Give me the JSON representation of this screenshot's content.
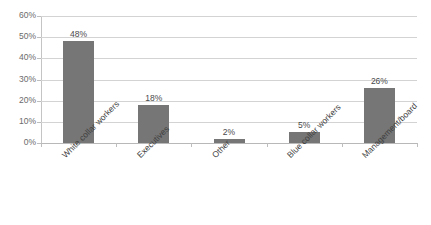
{
  "chart_data": {
    "type": "bar",
    "title": "",
    "subtitle": "",
    "xlabel": "",
    "ylabel": "",
    "categories": [
      "White collar workers",
      "Executives",
      "Other",
      "Blue collar workers",
      "Management/board"
    ],
    "values": [
      48,
      18,
      2,
      5,
      26
    ],
    "data_labels": [
      "48%",
      "18%",
      "2%",
      "5%",
      "26%"
    ],
    "ylim": [
      0,
      60
    ],
    "ytick_values": [
      0,
      10,
      20,
      30,
      40,
      50,
      60
    ],
    "ytick_labels": [
      "0%",
      "10%",
      "20%",
      "30%",
      "40%",
      "50%",
      "60%"
    ],
    "grid": true,
    "legend": false,
    "legend_position": "none",
    "bar_color": "#767676",
    "gridline_color": "#d3d3d3",
    "background_color": "#ffffff",
    "axis_text_color": "#6b6b6b",
    "label_rotation": -45
  }
}
